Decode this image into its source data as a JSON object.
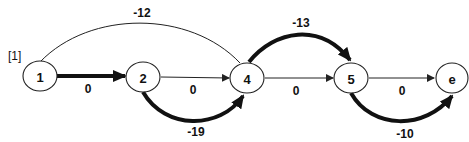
{
  "diagram": {
    "tag": "[1]",
    "nodes": [
      {
        "id": "1",
        "label": "1"
      },
      {
        "id": "2",
        "label": "2"
      },
      {
        "id": "4",
        "label": "4"
      },
      {
        "id": "5",
        "label": "5"
      },
      {
        "id": "e",
        "label": "e"
      }
    ],
    "edges": [
      {
        "from": "1",
        "to": "2",
        "weight": "0",
        "style": "thick"
      },
      {
        "from": "2",
        "to": "4",
        "weight": "0",
        "style": "thin"
      },
      {
        "from": "2",
        "to": "4",
        "weight": "-19",
        "style": "thick",
        "route": "below"
      },
      {
        "from": "1",
        "to": "4",
        "weight": "-12",
        "style": "thin",
        "route": "above"
      },
      {
        "from": "4",
        "to": "5",
        "weight": "0",
        "style": "thin"
      },
      {
        "from": "4",
        "to": "5",
        "weight": "-13",
        "style": "thick",
        "route": "above"
      },
      {
        "from": "5",
        "to": "e",
        "weight": "0",
        "style": "thin"
      },
      {
        "from": "5",
        "to": "e",
        "weight": "-10",
        "style": "thick",
        "route": "below"
      }
    ]
  }
}
